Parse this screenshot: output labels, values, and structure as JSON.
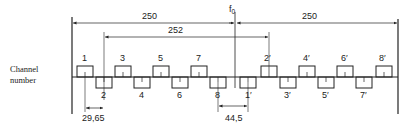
{
  "diagram": {
    "side_label": [
      "Channel",
      "number"
    ],
    "center_label": "f0",
    "dimensions": {
      "left_span": "250",
      "right_span": "250",
      "offset_span": "252",
      "channel_spacing": "29,65",
      "center_gap": "44,5"
    },
    "lower_group_channels": [
      {
        "label": "1",
        "pos": "up"
      },
      {
        "label": "2",
        "pos": "down"
      },
      {
        "label": "3",
        "pos": "up"
      },
      {
        "label": "4",
        "pos": "down"
      },
      {
        "label": "5",
        "pos": "up"
      },
      {
        "label": "6",
        "pos": "down"
      },
      {
        "label": "7",
        "pos": "up"
      },
      {
        "label": "8",
        "pos": "down"
      }
    ],
    "upper_group_channels": [
      {
        "label": "1′",
        "pos": "down"
      },
      {
        "label": "2′",
        "pos": "up"
      },
      {
        "label": "3′",
        "pos": "down"
      },
      {
        "label": "4′",
        "pos": "up"
      },
      {
        "label": "5′",
        "pos": "down"
      },
      {
        "label": "6′",
        "pos": "up"
      },
      {
        "label": "7′",
        "pos": "down"
      },
      {
        "label": "8′",
        "pos": "up"
      }
    ],
    "colors": {
      "line": "#222222",
      "background": "#ffffff"
    }
  }
}
